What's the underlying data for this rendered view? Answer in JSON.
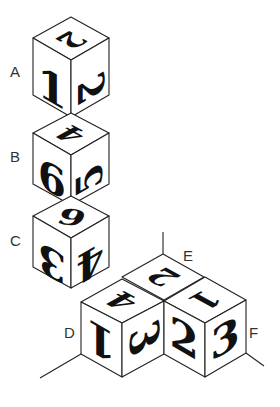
{
  "figure": {
    "cubes": [
      {
        "label": "A",
        "faces": {
          "top": "2",
          "left": "1",
          "right": "2"
        }
      },
      {
        "label": "B",
        "faces": {
          "top": "4",
          "left": "6",
          "right": "5"
        }
      },
      {
        "label": "C",
        "faces": {
          "top": "6",
          "left": "3",
          "right": "4"
        }
      },
      {
        "label": "D",
        "faces": {
          "top": "4",
          "left": "1",
          "right": "3"
        }
      },
      {
        "label": "E",
        "faces": {
          "top": "2"
        }
      },
      {
        "label": "F",
        "faces": {
          "top": "1",
          "left": "2",
          "right": "3"
        }
      }
    ],
    "labels": {
      "A": "A",
      "B": "B",
      "C": "C",
      "D": "D",
      "E": "E",
      "F": "F"
    }
  }
}
